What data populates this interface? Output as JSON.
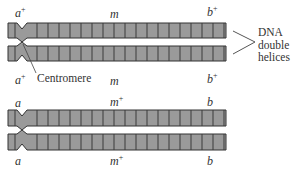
{
  "figure": {
    "top_cutoff_text": "",
    "colors": {
      "chromatid_fill": "#9a9a9a",
      "chromatid_stroke": "#333333",
      "band_line": "#3a3a3a",
      "background": "#ffffff"
    },
    "chromosomes": [
      {
        "id": "chromosome-1",
        "top_labels": [
          {
            "allele": "a",
            "sup": "+"
          },
          {
            "allele": "m",
            "sup": ""
          },
          {
            "allele": "b",
            "sup": "+"
          }
        ],
        "bottom_labels": [
          {
            "allele": "a",
            "sup": "+"
          },
          {
            "allele": "m",
            "sup": ""
          },
          {
            "allele": "b",
            "sup": "+"
          }
        ]
      },
      {
        "id": "chromosome-2",
        "top_labels": [
          {
            "allele": "a",
            "sup": ""
          },
          {
            "allele": "m",
            "sup": "+"
          },
          {
            "allele": "b",
            "sup": ""
          }
        ],
        "bottom_labels": [
          {
            "allele": "a",
            "sup": ""
          },
          {
            "allele": "m",
            "sup": "+"
          },
          {
            "allele": "b",
            "sup": ""
          }
        ]
      }
    ],
    "annotations": {
      "centromere": "Centromere",
      "dna_label_lines": [
        "DNA",
        "double",
        "helices"
      ]
    }
  }
}
